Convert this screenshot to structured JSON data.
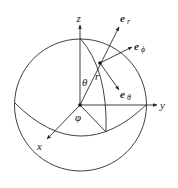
{
  "figure": {
    "axes": {
      "x": "x",
      "y": "y",
      "z": "z"
    },
    "coordinates": {
      "radius": "r",
      "polar": "θ",
      "azimuth": "φ"
    },
    "unit_vectors": [
      {
        "base": "e",
        "sub": "r"
      },
      {
        "base": "e",
        "sub": "ϕ"
      },
      {
        "base": "e",
        "sub": "θ"
      }
    ]
  }
}
